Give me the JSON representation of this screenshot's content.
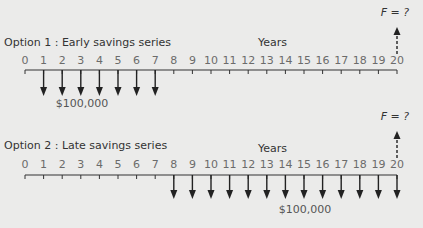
{
  "diagram": {
    "options": [
      {
        "label": "Option 1 : Early savings series",
        "axis_label": "Years",
        "years": [
          0,
          1,
          2,
          3,
          4,
          5,
          6,
          7,
          8,
          9,
          10,
          11,
          12,
          13,
          14,
          15,
          16,
          17,
          18,
          19,
          20
        ],
        "deposit_years": [
          1,
          2,
          3,
          4,
          5,
          6,
          7
        ],
        "deposit_amount": "$100,000",
        "future_value_label": "F = ?",
        "future_value_year": 20
      },
      {
        "label": "Option 2 : Late savings series",
        "axis_label": "Years",
        "years": [
          0,
          1,
          2,
          3,
          4,
          5,
          6,
          7,
          8,
          9,
          10,
          11,
          12,
          13,
          14,
          15,
          16,
          17,
          18,
          19,
          20
        ],
        "deposit_years": [
          8,
          9,
          10,
          11,
          12,
          13,
          14,
          15,
          16,
          17,
          18,
          19,
          20
        ],
        "deposit_amount": "$100,000",
        "future_value_label": "F = ?",
        "future_value_year": 20
      }
    ]
  },
  "colors": {
    "background": "#ebebea",
    "line": "#333333",
    "text": "#3a3a3a",
    "tick_text": "#6b6b6b"
  }
}
